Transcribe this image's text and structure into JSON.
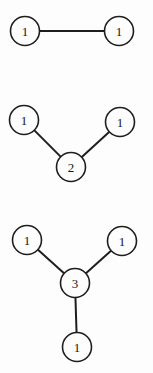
{
  "diagram": {
    "background_color": "#fdfdfd",
    "stroke_color": "#201d1d",
    "node_fill": "#fdfdfd",
    "node_radius": 14.5,
    "edge_width": 2,
    "node_stroke_width": 1.6,
    "graphs": [
      {
        "id": "graph-1",
        "name": "two-node-edge",
        "nodes": [
          {
            "id": "g1-n1",
            "label": "1",
            "cx": 25,
            "cy": 31
          },
          {
            "id": "g1-n2",
            "label": "1",
            "cx": 119,
            "cy": 31
          }
        ],
        "edges": [
          {
            "id": "g1-e1",
            "from": "g1-n1",
            "to": "g1-n2"
          }
        ]
      },
      {
        "id": "graph-2",
        "name": "three-node-vee",
        "nodes": [
          {
            "id": "g2-n1",
            "label": "1",
            "cx": 24,
            "cy": 120
          },
          {
            "id": "g2-n2",
            "label": "1",
            "cx": 120,
            "cy": 122
          },
          {
            "id": "g2-n3",
            "label": "2",
            "cx": 71,
            "cy": 167
          }
        ],
        "edges": [
          {
            "id": "g2-e1",
            "from": "g2-n1",
            "to": "g2-n3"
          },
          {
            "id": "g2-e2",
            "from": "g2-n2",
            "to": "g2-n3"
          }
        ]
      },
      {
        "id": "graph-3",
        "name": "four-node-star",
        "nodes": [
          {
            "id": "g3-n1",
            "label": "1",
            "cx": 27,
            "cy": 240
          },
          {
            "id": "g3-n2",
            "label": "1",
            "cx": 122,
            "cy": 241
          },
          {
            "id": "g3-n3",
            "label": "3",
            "cx": 75,
            "cy": 283
          },
          {
            "id": "g3-n4",
            "label": "1",
            "cx": 77,
            "cy": 347
          }
        ],
        "edges": [
          {
            "id": "g3-e1",
            "from": "g3-n1",
            "to": "g3-n3"
          },
          {
            "id": "g3-e2",
            "from": "g3-n2",
            "to": "g3-n3"
          },
          {
            "id": "g3-e3",
            "from": "g3-n3",
            "to": "g3-n4"
          }
        ]
      }
    ]
  }
}
